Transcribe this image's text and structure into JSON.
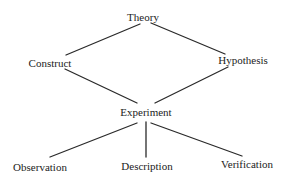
{
  "diagram": {
    "type": "hierarchy",
    "colors": {
      "background": "#ffffff",
      "text": "#222222",
      "line": "#2a2a2a"
    },
    "nodes": {
      "theory": {
        "label": "Theory",
        "x": 143,
        "y": 12
      },
      "construct": {
        "label": "Construct",
        "x": 50,
        "y": 58
      },
      "hypothesis": {
        "label": "Hypothesis",
        "x": 243,
        "y": 55
      },
      "experiment": {
        "label": "Experiment",
        "x": 146,
        "y": 107
      },
      "observation": {
        "label": "Observation",
        "x": 40,
        "y": 162
      },
      "description": {
        "label": "Description",
        "x": 147,
        "y": 161
      },
      "verification": {
        "label": "Verification",
        "x": 247,
        "y": 159
      }
    },
    "edges": [
      {
        "from": "theory",
        "to": "construct",
        "x1": 140,
        "y1": 24,
        "x2": 66,
        "y2": 55
      },
      {
        "from": "theory",
        "to": "hypothesis",
        "x1": 151,
        "y1": 23,
        "x2": 225,
        "y2": 54
      },
      {
        "from": "construct",
        "to": "experiment",
        "x1": 65,
        "y1": 69,
        "x2": 137,
        "y2": 103
      },
      {
        "from": "hypothesis",
        "to": "experiment",
        "x1": 228,
        "y1": 67,
        "x2": 155,
        "y2": 103
      },
      {
        "from": "experiment",
        "to": "observation",
        "x1": 137,
        "y1": 123,
        "x2": 50,
        "y2": 157
      },
      {
        "from": "experiment",
        "to": "description",
        "x1": 146,
        "y1": 122,
        "x2": 146,
        "y2": 157
      },
      {
        "from": "experiment",
        "to": "verification",
        "x1": 151,
        "y1": 123,
        "x2": 242,
        "y2": 156
      }
    ]
  }
}
